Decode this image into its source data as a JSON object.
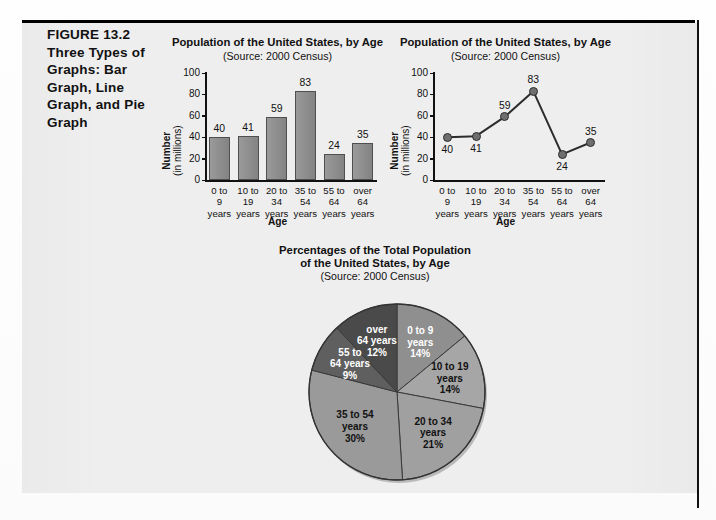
{
  "figure": {
    "number": "FIGURE 13.2",
    "caption": "Three Types of Graphs: Bar Graph, Line Graph, and Pie Graph"
  },
  "colors": {
    "panel_bg": "#eeeeee",
    "bar_fill": "#8d8d8d",
    "bar_stroke": "#4f4f4f",
    "dot_fill": "#6f6f6f",
    "line_stroke": "#2c2c2c",
    "text": "#111111"
  },
  "chart_data": [
    {
      "type": "bar",
      "name": "bar-graph",
      "title": "Population of the United States, by Age",
      "subtitle": "(Source: 2000 Census)",
      "xlabel": "Age",
      "ylabel": "Number",
      "ylabel_sub": "(in millions)",
      "ylim": [
        0,
        100
      ],
      "yticks": [
        100,
        80,
        60,
        40,
        20,
        0
      ],
      "grid": false,
      "categories": [
        "0 to\n9\nyears",
        "10 to\n19\nyears",
        "20 to\n34\nyears",
        "35 to\n54\nyears",
        "55 to\n64\nyears",
        "over\n64\nyears"
      ],
      "category_lines": [
        [
          "0 to",
          "9",
          "years"
        ],
        [
          "10 to",
          "19",
          "years"
        ],
        [
          "20 to",
          "34",
          "years"
        ],
        [
          "35 to",
          "54",
          "years"
        ],
        [
          "55 to",
          "64",
          "years"
        ],
        [
          "over",
          "64",
          "years"
        ]
      ],
      "values": [
        40,
        41,
        59,
        83,
        24,
        35
      ]
    },
    {
      "type": "line",
      "name": "line-graph",
      "title": "Population of the United States, by Age",
      "subtitle": "(Source: 2000 Census)",
      "xlabel": "Age",
      "ylabel": "Number",
      "ylabel_sub": "(in millions)",
      "ylim": [
        0,
        100
      ],
      "yticks": [
        100,
        80,
        60,
        40,
        20,
        0
      ],
      "grid": false,
      "categories": [
        "0 to\n9\nyears",
        "10 to\n19\nyears",
        "20 to\n34\nyears",
        "35 to\n54\nyears",
        "55 to\n64\nyears",
        "over\n64\nyears"
      ],
      "category_lines": [
        [
          "0 to",
          "9",
          "years"
        ],
        [
          "10 to",
          "19",
          "years"
        ],
        [
          "20 to",
          "34",
          "years"
        ],
        [
          "35 to",
          "54",
          "years"
        ],
        [
          "55 to",
          "64",
          "years"
        ],
        [
          "over",
          "64",
          "years"
        ]
      ],
      "values": [
        40,
        41,
        59,
        83,
        24,
        35
      ],
      "value_label_positions": [
        "below",
        "below",
        "above",
        "above",
        "below",
        "above"
      ]
    },
    {
      "type": "pie",
      "name": "pie-graph",
      "title_line1": "Percentages of the Total Population",
      "title_line2": "of the United States, by Age",
      "subtitle": "(Source: 2000 Census)",
      "slices": [
        {
          "label_lines": [
            "0 to 9",
            "years",
            "14%"
          ],
          "value": 14,
          "color": "#8f8f8f",
          "text_color": "light"
        },
        {
          "label_lines": [
            "10 to 19",
            "years",
            "14%"
          ],
          "value": 14,
          "color": "#a6a6a6",
          "text_color": "dark"
        },
        {
          "label_lines": [
            "20 to 34",
            "years",
            "21%"
          ],
          "value": 21,
          "color": "#a0a0a0",
          "text_color": "dark"
        },
        {
          "label_lines": [
            "35 to 54",
            "years",
            "30%"
          ],
          "value": 30,
          "color": "#9a9a9a",
          "text_color": "dark"
        },
        {
          "label_lines": [
            "55 to",
            "64 years",
            "9%"
          ],
          "value": 9,
          "color": "#5f5f5f",
          "text_color": "light"
        },
        {
          "label_lines": [
            "over",
            "64 years",
            "12%"
          ],
          "value": 12,
          "color": "#4a4a4a",
          "text_color": "light"
        }
      ]
    }
  ]
}
